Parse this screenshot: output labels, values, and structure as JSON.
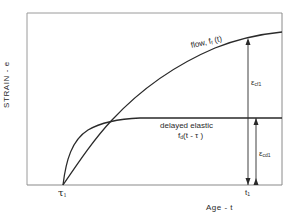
{
  "diagram": {
    "type": "strain-vs-age creep diagram",
    "frame": {
      "left": 27,
      "top": 13,
      "right": 282,
      "bottom": 185
    },
    "axes": {
      "y_label": "STRAIN - e",
      "x_label": "Age - t",
      "x_ticks": [
        {
          "label": "τ",
          "subscript": "1",
          "x": 63
        },
        {
          "label": "t",
          "subscript": "1",
          "x": 248
        }
      ]
    },
    "curves": [
      {
        "name": "flow",
        "label": "flow, f",
        "label_sub": "f",
        "label_suffix": " (t)",
        "description": "monotonically increasing concave curve from τ1"
      },
      {
        "name": "delayed-elastic",
        "label": "delayed elastic",
        "formula_prefix": "f",
        "formula_sub": "d",
        "formula_suffix": "(t - τ )",
        "description": "rapid rise then flat plateau"
      }
    ],
    "annotations": [
      {
        "name": "flow-strain",
        "symbol": "ε",
        "subscript": "cf",
        "sub2": "1"
      },
      {
        "name": "delayed-elastic-strain",
        "symbol": "ε",
        "subscript": "cd",
        "sub2": "1"
      }
    ],
    "colors": {
      "line": "#2a2a2a",
      "frame": "#8a8a8a",
      "background": "#ffffff"
    }
  }
}
